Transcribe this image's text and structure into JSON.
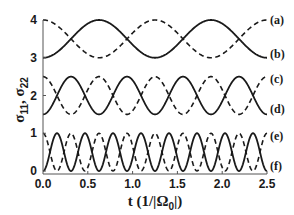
{
  "chart_data": {
    "type": "line",
    "title": "",
    "xlabel": "t (1/|Ω0|)",
    "ylabel": "σ11, σ22",
    "xlim": [
      0.0,
      2.5
    ],
    "ylim": [
      0,
      4
    ],
    "grid": false,
    "legend_position": "right (inline labels)",
    "x_ticks": [
      "0.0",
      "0.5",
      "1.0",
      "1.5",
      "2.0",
      "2.5"
    ],
    "y_ticks": [
      "0",
      "1",
      "2",
      "3",
      "4"
    ],
    "series": [
      {
        "name": "(a)",
        "style": "dashed",
        "center": 3.5,
        "amplitude": 0.5,
        "period": 1.25,
        "phase": "starts at max (4)",
        "formula": "3.5 + 0.5*cos(2*pi*t/1.25)"
      },
      {
        "name": "(b)",
        "style": "solid",
        "center": 3.5,
        "amplitude": 0.5,
        "period": 1.25,
        "phase": "starts at min (3)",
        "formula": "3.5 - 0.5*cos(2*pi*t/1.25)"
      },
      {
        "name": "(c)",
        "style": "dashed",
        "center": 2.0,
        "amplitude": 0.5,
        "period": 0.625,
        "phase": "starts at max (2.5)",
        "formula": "2.0 + 0.5*cos(2*pi*t/0.625)"
      },
      {
        "name": "(d)",
        "style": "solid",
        "center": 2.0,
        "amplitude": 0.5,
        "period": 0.625,
        "phase": "starts at min (1.5)",
        "formula": "2.0 - 0.5*cos(2*pi*t/0.625)"
      },
      {
        "name": "(e)",
        "style": "dashed",
        "center": 0.5,
        "amplitude": 0.5,
        "period": 0.3125,
        "phase": "starts at max (1)",
        "formula": "0.5 + 0.5*cos(2*pi*t/0.3125)"
      },
      {
        "name": "(f)",
        "style": "solid",
        "center": 0.5,
        "amplitude": 0.5,
        "period": 0.3125,
        "phase": "starts at min (0)",
        "formula": "0.5 - 0.5*cos(2*pi*t/0.3125)"
      }
    ]
  },
  "labels": {
    "xlabel_main": "t (1/|Ω",
    "xlabel_sub": "0",
    "xlabel_end": "|)",
    "ylabel_sigma11": "σ",
    "ylabel_sub11": "11",
    "ylabel_comma": ", ",
    "ylabel_sigma22": "σ",
    "ylabel_sub22": "22"
  },
  "colors": {
    "line": "#1a1a1a",
    "axis": "#555555",
    "background": "#ffffff"
  }
}
